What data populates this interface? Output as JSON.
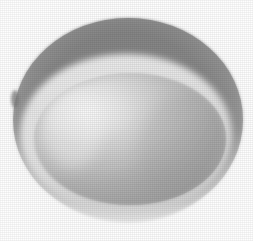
{
  "image": {
    "title": "Grayscale photograph of a hemispherical bowl",
    "subject": "bowl",
    "view": "oblique top-down",
    "rendering": "dithered halftone grayscale scan",
    "background_color": "#fefefe",
    "canvas": {
      "width": 253,
      "height": 241
    }
  },
  "shapes": {
    "outer_rim": {
      "name": "outer-rim-ellipse",
      "cx": 128,
      "cy": 120,
      "rx": 115,
      "ry": 102,
      "color_top": "#8b8b8b",
      "color_bottom": "#cfcfcf",
      "description": "Outer elliptical rim of the bowl, dark gray at top, pale gray at bottom"
    },
    "rim_highlight": {
      "name": "rim-highlight-band",
      "color": "#e6e6e6",
      "description": "Bright narrow band along the inner edge of the rim at upper-left"
    },
    "inner_cavity": {
      "name": "inner-cavity-ellipse",
      "cx": 130,
      "cy": 139,
      "rx": 96,
      "ry": 66,
      "color_highlight": "#f0f0f0",
      "color_mid": "#b4b4b4",
      "color_shadow": "#9a9a9a",
      "description": "Inner bowl cavity, bright highlight upper-left fading to mid gray right and bottom"
    },
    "specular_highlight": {
      "name": "specular-highlight",
      "cx": 86,
      "cy": 112,
      "rx": 44,
      "ry": 30,
      "color": "#f6f6f6",
      "description": "Bright specular reflection inside the bowl at the upper-left"
    },
    "dark_notch": {
      "name": "left-edge-dark-notch",
      "x": 14,
      "y": 96,
      "color": "#6e6e6e",
      "description": "Small dark speck on the far left edge of the rim"
    }
  },
  "palette": {
    "background": "#fefefe",
    "rim_dark": "#8a8a8a",
    "rim_mid": "#a8a8a8",
    "rim_light": "#d6d6d6",
    "cavity_light": "#f2f2f2",
    "cavity_mid": "#b6b6b6",
    "cavity_dark": "#989898",
    "outline": "#9d9d9d"
  }
}
